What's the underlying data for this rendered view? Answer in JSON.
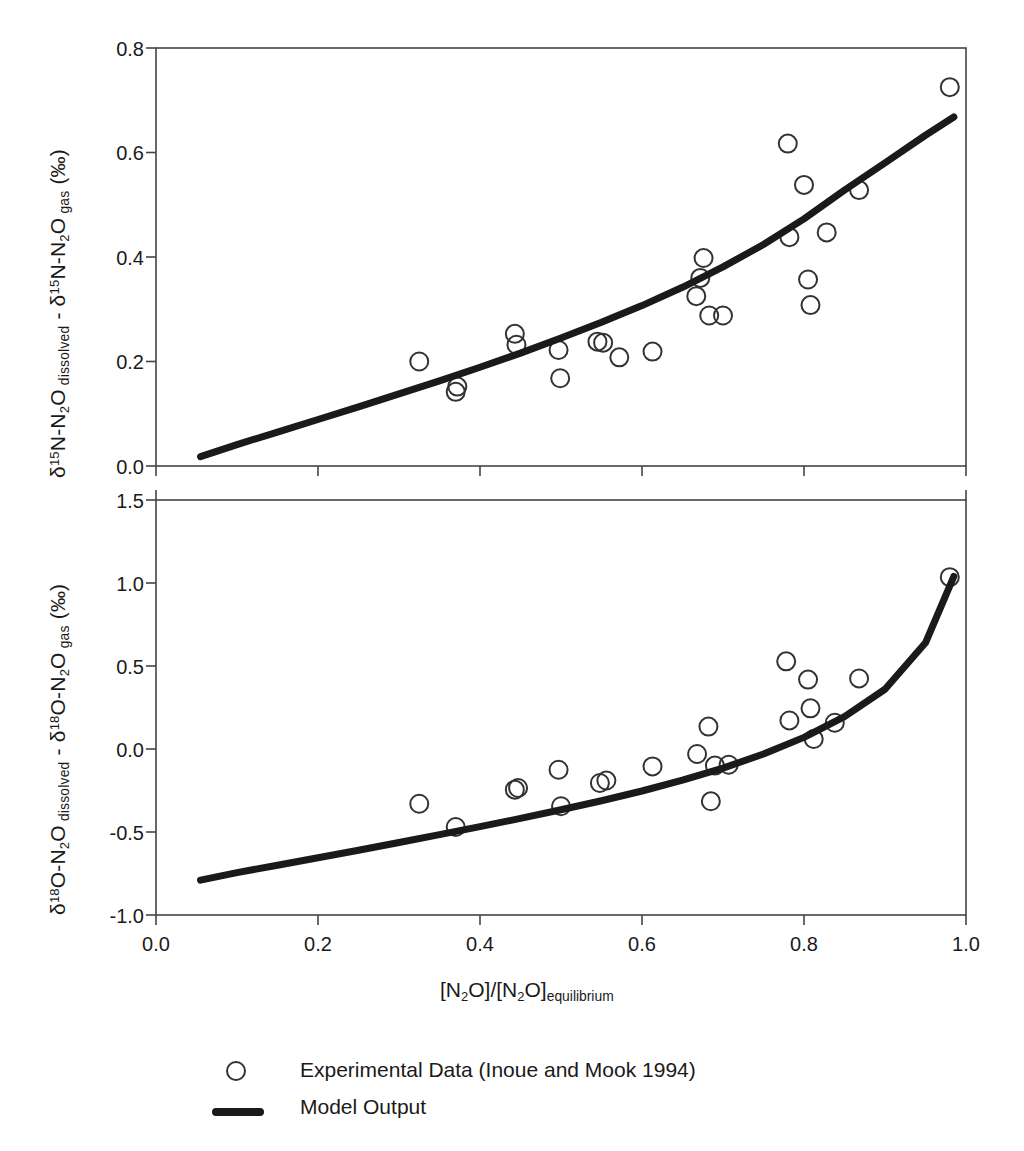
{
  "figure": {
    "background": "#ffffff",
    "ink_color": "#1a1a1a",
    "marker_color": "#333333",
    "line_color": "#1a1a1a"
  },
  "panels": {
    "top": {
      "ylabel_parts": {
        "d1": "δ",
        "sup1": "15",
        "mid1": "N-N",
        "sub1": "2",
        "mid2": "O",
        "word1": "dissolved",
        "dash": " - ",
        "d2": "δ",
        "sup2": "15",
        "mid3": "N-N",
        "sub2": "2",
        "mid4": "O",
        "word2": "gas",
        "units": " (‰)"
      },
      "ylabel_text": "δ15N-N2Odissolved - δ15N-N2Ogas (‰)",
      "ytick_labels": [
        "0.0",
        "0.2",
        "0.4",
        "0.6",
        "0.8"
      ]
    },
    "bottom": {
      "ylabel_parts": {
        "d1": "δ",
        "sup1": "18",
        "mid1": "O-N",
        "sub1": "2",
        "mid2": "O",
        "word1": "dissolved",
        "dash": " - ",
        "d2": "δ",
        "sup2": "18",
        "mid3": "O-N",
        "sub2": "2",
        "mid4": "O",
        "word2": "gas",
        "units": " (‰)"
      },
      "ylabel_text": "δ18O-N2Odissolved - δ18O-N2Ogas (‰)",
      "ytick_labels": [
        "-1.0",
        "-0.5",
        "0.0",
        "0.5",
        "1.0",
        "1.5"
      ]
    }
  },
  "xaxis": {
    "label_parts": {
      "open": "[N",
      "sub1": "2",
      "mid": "O]/[N",
      "sub2": "2",
      "close": "O]",
      "word": "equilibrium"
    },
    "label_text": "[N2O]/[N2O]equilibrium",
    "tick_labels": [
      "0.0",
      "0.2",
      "0.4",
      "0.6",
      "0.8",
      "1.0"
    ]
  },
  "legend": {
    "items": [
      {
        "symbol": "open-circle",
        "label": "Experimental Data (Inoue and Mook 1994)"
      },
      {
        "symbol": "thick-line",
        "label": "Model Output"
      }
    ]
  },
  "chart_data": [
    {
      "type": "scatter",
      "panel": "top",
      "title": "",
      "xlabel": "[N2O]/[N2O]equilibrium",
      "ylabel": "δ15N-N2O dissolved - δ15N-N2O gas (‰)",
      "xlim": [
        0.0,
        1.0
      ],
      "ylim": [
        0.0,
        0.8
      ],
      "xticks": [
        0.0,
        0.2,
        0.4,
        0.6,
        0.8,
        1.0
      ],
      "yticks": [
        0.0,
        0.2,
        0.4,
        0.6,
        0.8
      ],
      "grid": false,
      "legend_position": "below-figure",
      "series": [
        {
          "name": "Experimental Data (Inoue and Mook 1994)",
          "marker": "open-circle",
          "points": [
            [
              0.325,
              0.2
            ],
            [
              0.37,
              0.142
            ],
            [
              0.372,
              0.152
            ],
            [
              0.443,
              0.253
            ],
            [
              0.445,
              0.232
            ],
            [
              0.497,
              0.222
            ],
            [
              0.499,
              0.168
            ],
            [
              0.545,
              0.238
            ],
            [
              0.552,
              0.236
            ],
            [
              0.572,
              0.208
            ],
            [
              0.613,
              0.219
            ],
            [
              0.667,
              0.325
            ],
            [
              0.672,
              0.36
            ],
            [
              0.676,
              0.398
            ],
            [
              0.683,
              0.288
            ],
            [
              0.7,
              0.288
            ],
            [
              0.78,
              0.617
            ],
            [
              0.782,
              0.438
            ],
            [
              0.8,
              0.538
            ],
            [
              0.805,
              0.357
            ],
            [
              0.808,
              0.308
            ],
            [
              0.828,
              0.447
            ],
            [
              0.868,
              0.528
            ],
            [
              0.98,
              0.725
            ]
          ]
        },
        {
          "name": "Model Output",
          "marker": "thick-line",
          "x": [
            0.055,
            0.1,
            0.15,
            0.2,
            0.25,
            0.3,
            0.35,
            0.4,
            0.45,
            0.5,
            0.55,
            0.6,
            0.65,
            0.7,
            0.75,
            0.8,
            0.85,
            0.9,
            0.95,
            0.985
          ],
          "y": [
            0.018,
            0.041,
            0.065,
            0.089,
            0.113,
            0.138,
            0.163,
            0.189,
            0.216,
            0.245,
            0.275,
            0.307,
            0.342,
            0.381,
            0.424,
            0.473,
            0.528,
            0.58,
            0.633,
            0.668
          ]
        }
      ]
    },
    {
      "type": "scatter",
      "panel": "bottom",
      "title": "",
      "xlabel": "[N2O]/[N2O]equilibrium",
      "ylabel": "δ18O-N2O dissolved - δ18O-N2O gas (‰)",
      "xlim": [
        0.0,
        1.0
      ],
      "ylim": [
        -1.0,
        1.5
      ],
      "xticks": [
        0.0,
        0.2,
        0.4,
        0.6,
        0.8,
        1.0
      ],
      "yticks": [
        -1.0,
        -0.5,
        0.0,
        0.5,
        1.0,
        1.5
      ],
      "grid": false,
      "legend_position": "below-figure",
      "series": [
        {
          "name": "Experimental Data (Inoue and Mook 1994)",
          "marker": "open-circle",
          "points": [
            [
              0.325,
              -0.33
            ],
            [
              0.37,
              -0.47
            ],
            [
              0.443,
              -0.245
            ],
            [
              0.447,
              -0.235
            ],
            [
              0.497,
              -0.125
            ],
            [
              0.5,
              -0.345
            ],
            [
              0.548,
              -0.205
            ],
            [
              0.556,
              -0.19
            ],
            [
              0.613,
              -0.105
            ],
            [
              0.668,
              -0.03
            ],
            [
              0.682,
              0.135
            ],
            [
              0.685,
              -0.315
            ],
            [
              0.69,
              -0.1
            ],
            [
              0.707,
              -0.095
            ],
            [
              0.778,
              0.528
            ],
            [
              0.782,
              0.172
            ],
            [
              0.805,
              0.418
            ],
            [
              0.808,
              0.245
            ],
            [
              0.812,
              0.06
            ],
            [
              0.838,
              0.158
            ],
            [
              0.868,
              0.425
            ],
            [
              0.98,
              1.035
            ]
          ]
        },
        {
          "name": "Model Output",
          "marker": "thick-line",
          "x": [
            0.055,
            0.1,
            0.15,
            0.2,
            0.25,
            0.3,
            0.35,
            0.4,
            0.45,
            0.5,
            0.55,
            0.6,
            0.65,
            0.7,
            0.75,
            0.8,
            0.85,
            0.9,
            0.95,
            0.985
          ],
          "y": [
            -0.79,
            -0.745,
            -0.7,
            -0.655,
            -0.61,
            -0.563,
            -0.516,
            -0.468,
            -0.418,
            -0.366,
            -0.312,
            -0.253,
            -0.188,
            -0.115,
            -0.03,
            0.07,
            0.195,
            0.36,
            0.64,
            1.04
          ]
        }
      ]
    }
  ]
}
